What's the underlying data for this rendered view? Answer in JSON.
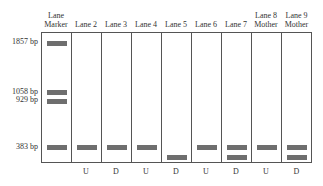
{
  "headers": [
    {
      "line1": "Lane",
      "line2": "Marker"
    },
    {
      "line1": "",
      "line2": "Lane 2"
    },
    {
      "line1": "",
      "line2": "Lane 3"
    },
    {
      "line1": "",
      "line2": "Lane 4"
    },
    {
      "line1": "",
      "line2": "Lane 5"
    },
    {
      "line1": "",
      "line2": "Lane 6"
    },
    {
      "line1": "",
      "line2": "Lane 7"
    },
    {
      "line1": "Lane 8",
      "line2": "Mother"
    },
    {
      "line1": "Lane 9",
      "line2": "Mother"
    }
  ],
  "size_labels": [
    {
      "label": "1857 bp",
      "y": 42
    },
    {
      "label": "1058 bp",
      "y": 91
    },
    {
      "label": "929 bp",
      "y": 99
    },
    {
      "label": "383 bp",
      "y": 146
    }
  ],
  "status_labels": [
    "",
    "U",
    "D",
    "U",
    "D",
    "U",
    "D",
    "U",
    "D"
  ],
  "lanes": [
    {
      "bands": [
        "1857",
        "1058",
        "929",
        "383"
      ]
    },
    {
      "bands": [
        "383"
      ]
    },
    {
      "bands": [
        "383"
      ]
    },
    {
      "bands": [
        "383"
      ]
    },
    {
      "bands": [
        "low"
      ]
    },
    {
      "bands": [
        "383"
      ]
    },
    {
      "bands": [
        "383",
        "low"
      ]
    },
    {
      "bands": [
        "383"
      ]
    },
    {
      "bands": [
        "383",
        "low"
      ]
    }
  ],
  "colors": {
    "band": "#6e6e6e",
    "border": "#555555"
  }
}
